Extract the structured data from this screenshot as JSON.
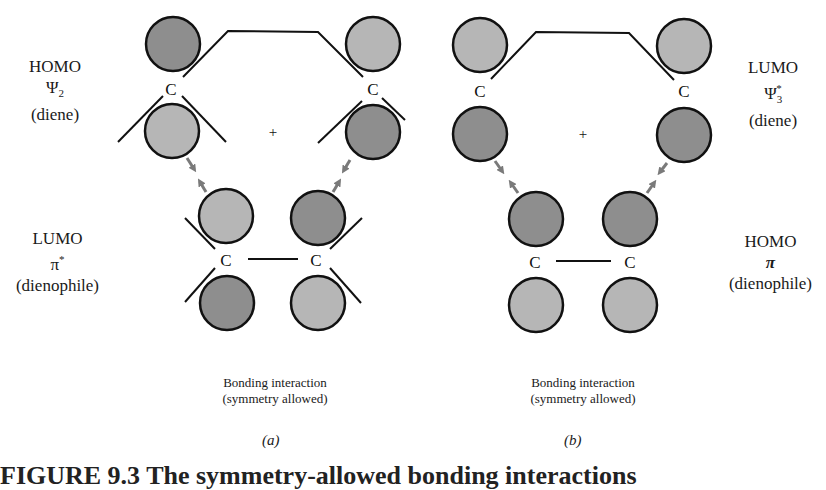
{
  "colors": {
    "dark_lobe": "#8e8e8e",
    "light_lobe": "#b6b6b6",
    "outline": "#111111",
    "arrow": "#7a7a7a",
    "line": "#111111"
  },
  "panels": [
    {
      "id": "a",
      "letter": "(a)",
      "caption_line1": "Bonding interaction",
      "caption_line2": "(symmetry allowed)",
      "diene_label": {
        "orbital": "HOMO",
        "symbol": "Ψ",
        "sub": "2",
        "sup": "",
        "molecule": "(diene)"
      },
      "dienophile_label": {
        "orbital": "LUMO",
        "symbol": "π",
        "sub": "",
        "sup": "*",
        "molecule": "(dienophile)"
      },
      "plus_sign": "+",
      "carbon_label": "C",
      "lobes": [
        {
          "cx": 173,
          "cy": 44,
          "shade": "dark"
        },
        {
          "cx": 172,
          "cy": 131,
          "shade": "light"
        },
        {
          "cx": 373,
          "cy": 44,
          "shade": "light"
        },
        {
          "cx": 373,
          "cy": 132,
          "shade": "dark"
        },
        {
          "cx": 226,
          "cy": 216,
          "shade": "light"
        },
        {
          "cx": 318,
          "cy": 218,
          "shade": "dark"
        },
        {
          "cx": 227,
          "cy": 303,
          "shade": "dark"
        },
        {
          "cx": 318,
          "cy": 303,
          "shade": "light"
        }
      ]
    },
    {
      "id": "b",
      "letter": "(b)",
      "caption_line1": "Bonding interaction",
      "caption_line2": "(symmetry allowed)",
      "diene_label": {
        "orbital": "LUMO",
        "symbol": "Ψ",
        "sub": "3",
        "sup": "*",
        "molecule": "(diene)"
      },
      "dienophile_label": {
        "orbital": "HOMO",
        "symbol": "π",
        "sub": "",
        "sup": "",
        "molecule": "(dienophile)"
      },
      "plus_sign": "+",
      "carbon_label": "C",
      "lobes": [
        {
          "cx": 480,
          "cy": 45,
          "shade": "light"
        },
        {
          "cx": 480,
          "cy": 134,
          "shade": "dark"
        },
        {
          "cx": 684,
          "cy": 46,
          "shade": "light"
        },
        {
          "cx": 684,
          "cy": 135,
          "shade": "dark"
        },
        {
          "cx": 536,
          "cy": 219,
          "shade": "dark"
        },
        {
          "cx": 630,
          "cy": 219,
          "shade": "dark"
        },
        {
          "cx": 536,
          "cy": 305,
          "shade": "light"
        },
        {
          "cx": 630,
          "cy": 305,
          "shade": "light"
        }
      ]
    }
  ],
  "figure_caption": "FIGURE 9.3  The symmetry-allowed bonding interactions"
}
